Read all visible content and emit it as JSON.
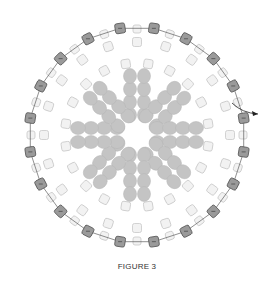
{
  "figure": {
    "caption": "FIGURE 3",
    "center": [
      137,
      135
    ],
    "colors": {
      "outer_bead_fill": "#9a9a9a",
      "outer_bead_stroke": "#555555",
      "light_bead_fill": "#f2f2f2",
      "light_bead_stroke": "#c8c8c8",
      "oval_bead_fill": "#c4c4c4",
      "thread": "#444444"
    },
    "outer_ring": {
      "radius": 108,
      "count": 20,
      "size": 10,
      "start_deg": -99
    },
    "between_ring": {
      "radius": 106,
      "count": 20,
      "size": 8,
      "start_deg": -90
    },
    "inner_ring": {
      "radius": 93,
      "count": 20,
      "size": 9,
      "start_deg": -90
    },
    "star_ring": {
      "radius": 72,
      "count": 20,
      "size": 9,
      "start_deg": -81
    },
    "petals": {
      "count": 8,
      "rx": 6.5,
      "ry": 7.5
    },
    "exit_arrow": {
      "from": [
        232,
        103
      ],
      "to": [
        258,
        114
      ]
    }
  }
}
